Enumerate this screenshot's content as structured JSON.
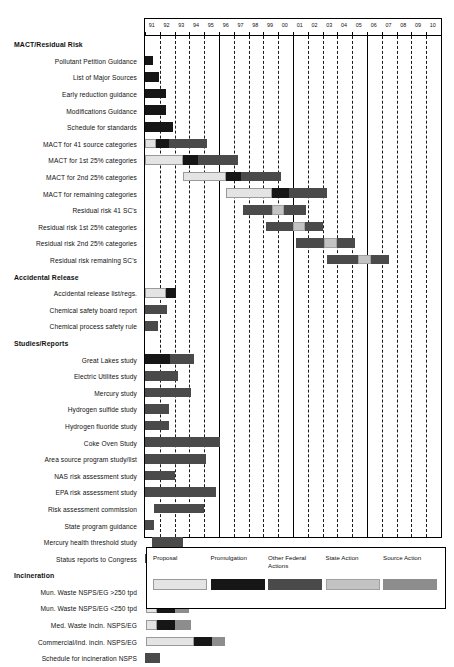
{
  "chart_data": {
    "type": "bar",
    "subtype": "gantt",
    "title": "",
    "xlabel": "",
    "ylabel": "",
    "axis": {
      "ticks": [
        "91",
        "92",
        "93",
        "94",
        "95",
        "96",
        "97",
        "98",
        "99",
        "00",
        "01",
        "02",
        "03",
        "04",
        "05",
        "06",
        "07",
        "08",
        "09",
        "10"
      ],
      "xlim": [
        91,
        111
      ],
      "grid": true,
      "grid_style": "dashed-vertical"
    },
    "legend": {
      "position": "bottom",
      "entries": [
        {
          "label": "Proposal",
          "key": "proposal",
          "color": "#e4e4e4"
        },
        {
          "label": "Promulgation",
          "key": "promulgation",
          "color": "#161616"
        },
        {
          "label": "Other Federal Actions",
          "key": "other",
          "color": "#4a4a4a"
        },
        {
          "label": "State Action",
          "key": "state",
          "color": "#c3c3c3"
        },
        {
          "label": "Source Action",
          "key": "source",
          "color": "#8d8d8d"
        }
      ]
    },
    "rows": [
      {
        "label": "MACT/Residual Risk",
        "group": true,
        "segments": []
      },
      {
        "label": "Pollutant Petition Guidance",
        "group": false,
        "segments": [
          {
            "cat": "promulgation",
            "start": 91.0,
            "end": 91.55
          }
        ]
      },
      {
        "label": "List of Major Sources",
        "group": false,
        "segments": [
          {
            "cat": "promulgation",
            "start": 91.0,
            "end": 91.95
          }
        ]
      },
      {
        "label": "Early reduction guidance",
        "group": false,
        "segments": [
          {
            "cat": "promulgation",
            "start": 91.0,
            "end": 92.4
          }
        ]
      },
      {
        "label": "Modifications Guidance",
        "group": false,
        "segments": [
          {
            "cat": "promulgation",
            "start": 91.0,
            "end": 92.4
          }
        ]
      },
      {
        "label": "Schedule for standards",
        "group": false,
        "segments": [
          {
            "cat": "promulgation",
            "start": 91.0,
            "end": 92.9
          }
        ]
      },
      {
        "label": "MACT for 41 source categories",
        "group": false,
        "segments": [
          {
            "cat": "proposal",
            "start": 91.0,
            "end": 91.75
          },
          {
            "cat": "promulgation",
            "start": 91.75,
            "end": 92.6
          },
          {
            "cat": "other",
            "start": 92.6,
            "end": 95.2
          }
        ]
      },
      {
        "label": "MACT for 1st 25% categories",
        "group": false,
        "segments": [
          {
            "cat": "proposal",
            "start": 91.0,
            "end": 93.6
          },
          {
            "cat": "promulgation",
            "start": 93.6,
            "end": 94.6
          },
          {
            "cat": "other",
            "start": 94.6,
            "end": 97.3
          }
        ]
      },
      {
        "label": "MACT for 2nd 25% categories",
        "group": false,
        "segments": [
          {
            "cat": "proposal",
            "start": 93.6,
            "end": 96.5
          },
          {
            "cat": "promulgation",
            "start": 96.5,
            "end": 97.5
          },
          {
            "cat": "other",
            "start": 97.5,
            "end": 100.2
          }
        ]
      },
      {
        "label": "MACT for remaining categories",
        "group": false,
        "segments": [
          {
            "cat": "proposal",
            "start": 96.5,
            "end": 99.6
          },
          {
            "cat": "promulgation",
            "start": 99.6,
            "end": 100.7
          },
          {
            "cat": "other",
            "start": 100.7,
            "end": 103.3
          }
        ]
      },
      {
        "label": "Residual risk 41 SC's",
        "group": false,
        "segments": [
          {
            "cat": "other",
            "start": 97.6,
            "end": 99.6
          },
          {
            "cat": "state",
            "start": 99.6,
            "end": 100.4
          },
          {
            "cat": "other",
            "start": 100.4,
            "end": 101.9
          }
        ]
      },
      {
        "label": "Residual risk 1st 25% categories",
        "group": false,
        "segments": [
          {
            "cat": "other",
            "start": 99.2,
            "end": 101.0
          },
          {
            "cat": "state",
            "start": 101.0,
            "end": 101.8
          },
          {
            "cat": "other",
            "start": 101.8,
            "end": 103.0
          }
        ]
      },
      {
        "label": "Residual risk 2nd 25% categories",
        "group": false,
        "segments": [
          {
            "cat": "other",
            "start": 101.2,
            "end": 103.1
          },
          {
            "cat": "state",
            "start": 103.1,
            "end": 104.0
          },
          {
            "cat": "other",
            "start": 104.0,
            "end": 105.2
          }
        ]
      },
      {
        "label": "Residual risk remaining SC's",
        "group": false,
        "segments": [
          {
            "cat": "other",
            "start": 103.3,
            "end": 105.4
          },
          {
            "cat": "state",
            "start": 105.4,
            "end": 106.3
          },
          {
            "cat": "other",
            "start": 106.3,
            "end": 107.5
          }
        ]
      },
      {
        "label": "Accidental Release",
        "group": true,
        "segments": []
      },
      {
        "label": "Accidental release list/regs.",
        "group": false,
        "segments": [
          {
            "cat": "proposal",
            "start": 91.0,
            "end": 92.4
          },
          {
            "cat": "promulgation",
            "start": 92.4,
            "end": 93.1
          }
        ]
      },
      {
        "label": "Chemical safety board report",
        "group": false,
        "segments": [
          {
            "cat": "other",
            "start": 91.0,
            "end": 92.5
          }
        ]
      },
      {
        "label": "Chemical process safety rule",
        "group": false,
        "segments": [
          {
            "cat": "other",
            "start": 91.0,
            "end": 91.9
          }
        ]
      },
      {
        "label": "Studies/Reports",
        "group": true,
        "segments": []
      },
      {
        "label": "Great Lakes study",
        "group": false,
        "segments": [
          {
            "cat": "promulgation",
            "start": 91.0,
            "end": 92.7
          },
          {
            "cat": "other",
            "start": 92.7,
            "end": 94.3
          }
        ]
      },
      {
        "label": "Electric Utilites study",
        "group": false,
        "segments": [
          {
            "cat": "other",
            "start": 91.0,
            "end": 93.2
          }
        ]
      },
      {
        "label": "Mercury study",
        "group": false,
        "segments": [
          {
            "cat": "other",
            "start": 91.0,
            "end": 94.1
          }
        ]
      },
      {
        "label": "Hydrogen sulfide study",
        "group": false,
        "segments": [
          {
            "cat": "other",
            "start": 91.0,
            "end": 92.6
          }
        ]
      },
      {
        "label": "Hydrogen fluoride study",
        "group": false,
        "segments": [
          {
            "cat": "other",
            "start": 91.0,
            "end": 92.6
          }
        ]
      },
      {
        "label": "Coke Oven Study",
        "group": false,
        "segments": [
          {
            "cat": "other",
            "start": 91.0,
            "end": 96.1
          }
        ]
      },
      {
        "label": "Area source program study/list",
        "group": false,
        "segments": [
          {
            "cat": "other",
            "start": 91.0,
            "end": 95.1
          }
        ]
      },
      {
        "label": "NAS risk assessment study",
        "group": false,
        "segments": [
          {
            "cat": "other",
            "start": 91.0,
            "end": 93.0
          }
        ]
      },
      {
        "label": "EPA risk assessment study",
        "group": false,
        "segments": [
          {
            "cat": "other",
            "start": 91.0,
            "end": 95.8
          }
        ]
      },
      {
        "label": "Risk assessment commission",
        "group": false,
        "segments": [
          {
            "cat": "other",
            "start": 91.6,
            "end": 95.0
          }
        ]
      },
      {
        "label": "State program guidance",
        "group": false,
        "segments": [
          {
            "cat": "other",
            "start": 91.0,
            "end": 91.6
          }
        ]
      },
      {
        "label": "Mercury health threshold study",
        "group": false,
        "segments": [
          {
            "cat": "other",
            "start": 91.5,
            "end": 93.6
          }
        ]
      },
      {
        "label": "Status reports to Congress",
        "group": false,
        "segments": [
          {
            "cat": "other",
            "start": 91.0,
            "end": 92.6
          }
        ]
      },
      {
        "label": "Incineration",
        "group": true,
        "segments": []
      },
      {
        "label": "Mun. Waste NSPS/EG >250 tpd",
        "group": false,
        "segments": [
          {
            "cat": "promulgation",
            "start": 91.1,
            "end": 91.9
          },
          {
            "cat": "source",
            "start": 91.9,
            "end": 92.8
          }
        ]
      },
      {
        "label": "Mun. Waste NSPS/EG <250 tpd",
        "group": false,
        "segments": [
          {
            "cat": "proposal",
            "start": 91.1,
            "end": 91.8
          },
          {
            "cat": "promulgation",
            "start": 91.8,
            "end": 93.0
          },
          {
            "cat": "source",
            "start": 93.0,
            "end": 94.0
          }
        ]
      },
      {
        "label": "Med. Waste Incin. NSPS/EG",
        "group": false,
        "segments": [
          {
            "cat": "proposal",
            "start": 91.1,
            "end": 91.8
          },
          {
            "cat": "promulgation",
            "start": 91.8,
            "end": 93.0
          },
          {
            "cat": "source",
            "start": 93.0,
            "end": 94.1
          }
        ]
      },
      {
        "label": "Commercial/ind. incin. NSPS/EG",
        "group": false,
        "segments": [
          {
            "cat": "proposal",
            "start": 91.1,
            "end": 94.3
          },
          {
            "cat": "promulgation",
            "start": 94.3,
            "end": 95.5
          },
          {
            "cat": "source",
            "start": 95.5,
            "end": 96.4
          }
        ]
      },
      {
        "label": "Schedule for incineration NSPS",
        "group": false,
        "segments": [
          {
            "cat": "other",
            "start": 91.0,
            "end": 92.0
          }
        ]
      }
    ]
  }
}
